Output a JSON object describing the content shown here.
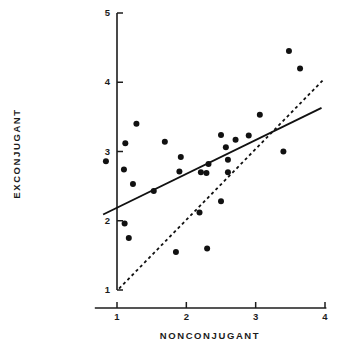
{
  "chart_data": {
    "type": "scatter",
    "title": "",
    "xlabel": "NONCONJUGANT",
    "ylabel": "EXCONJUGANT",
    "xlim": [
      0.65,
      4.05
    ],
    "ylim": [
      1.0,
      5.0
    ],
    "xticks": [
      1,
      2,
      3,
      4
    ],
    "yticks": [
      1,
      2,
      3,
      4,
      5
    ],
    "xtick_labels": [
      "1",
      "2",
      "3",
      "4"
    ],
    "ytick_labels": [
      "1",
      "2",
      "3",
      "4",
      "5"
    ],
    "grid": false,
    "legend": "none",
    "marker": "filled-circle",
    "marker_color": "#111111",
    "marker_size_px": 5.2,
    "points": [
      {
        "x": 0.84,
        "y": 2.86
      },
      {
        "x": 1.12,
        "y": 3.12
      },
      {
        "x": 1.28,
        "y": 3.4
      },
      {
        "x": 1.1,
        "y": 2.74
      },
      {
        "x": 1.23,
        "y": 2.53
      },
      {
        "x": 1.11,
        "y": 1.96
      },
      {
        "x": 1.17,
        "y": 1.75
      },
      {
        "x": 1.53,
        "y": 2.43
      },
      {
        "x": 1.69,
        "y": 3.14
      },
      {
        "x": 1.9,
        "y": 2.71
      },
      {
        "x": 1.92,
        "y": 2.92
      },
      {
        "x": 1.85,
        "y": 1.55
      },
      {
        "x": 2.19,
        "y": 2.12
      },
      {
        "x": 2.21,
        "y": 2.7
      },
      {
        "x": 2.29,
        "y": 2.69
      },
      {
        "x": 2.32,
        "y": 2.82
      },
      {
        "x": 2.3,
        "y": 1.6
      },
      {
        "x": 2.5,
        "y": 3.24
      },
      {
        "x": 2.57,
        "y": 3.06
      },
      {
        "x": 2.6,
        "y": 2.88
      },
      {
        "x": 2.6,
        "y": 2.7
      },
      {
        "x": 2.5,
        "y": 2.28
      },
      {
        "x": 2.71,
        "y": 3.17
      },
      {
        "x": 2.9,
        "y": 3.23
      },
      {
        "x": 3.06,
        "y": 3.53
      },
      {
        "x": 3.4,
        "y": 3.0
      },
      {
        "x": 3.48,
        "y": 4.45
      },
      {
        "x": 3.64,
        "y": 4.2
      }
    ],
    "lines": [
      {
        "name": "regression-line-solid",
        "style": "solid",
        "color": "#111111",
        "width_px": 1.9,
        "x0": 0.8,
        "y0": 2.09,
        "x1": 3.95,
        "y1": 3.63
      },
      {
        "name": "reference-line-dashed",
        "style": "dashed",
        "color": "#111111",
        "width_px": 1.8,
        "dash": "3,3",
        "x0": 1.03,
        "y0": 1.02,
        "x1": 3.99,
        "y1": 4.05
      }
    ],
    "axes": {
      "y_axis_x": 1.0,
      "y_axis_top": 5.0,
      "y_axis_bottom": 1.0,
      "x_axis_y": 1.0,
      "x_axis_left": 0.68,
      "x_axis_right": 4.02,
      "axis_color": "#1c1c1c",
      "tick_length_px": 6
    }
  }
}
